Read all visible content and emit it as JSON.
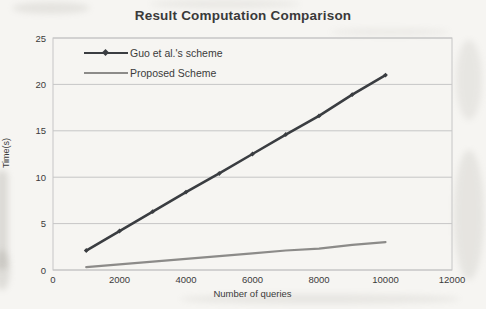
{
  "chart_data": {
    "type": "line",
    "title": "Result Computation Comparison",
    "xlabel": "Number of queries",
    "ylabel": "Time(s)",
    "xlim": [
      0,
      12000
    ],
    "ylim": [
      0,
      25
    ],
    "xticks": [
      0,
      2000,
      4000,
      6000,
      8000,
      10000,
      12000
    ],
    "yticks": [
      0,
      5,
      10,
      15,
      20,
      25
    ],
    "grid": "horizontal",
    "legend_position": "top-left-inside",
    "x": [
      1000,
      2000,
      3000,
      4000,
      5000,
      6000,
      7000,
      8000,
      9000,
      10000
    ],
    "series": [
      {
        "name": "Guo et al.'s scheme",
        "color": "#3a3d41",
        "marker": "diamond",
        "line_width": 2.6,
        "values": [
          2.1,
          4.2,
          6.3,
          8.4,
          10.4,
          12.5,
          14.6,
          16.6,
          18.9,
          21.0
        ]
      },
      {
        "name": "Proposed Scheme",
        "color": "#8c8b89",
        "marker": "none",
        "line_width": 2.2,
        "values": [
          0.3,
          0.6,
          0.9,
          1.2,
          1.5,
          1.8,
          2.1,
          2.3,
          2.7,
          3.0
        ]
      }
    ]
  },
  "colors": {
    "text": "#3b3b3b",
    "grid": "#c6c6c6",
    "plot_border": "#c6c6c6",
    "background": "#f6f5f2"
  }
}
